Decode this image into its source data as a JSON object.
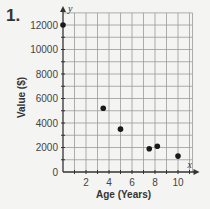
{
  "problem_number": "1.",
  "chart_data": {
    "type": "scatter",
    "title": "",
    "xlabel": "Age (Years)",
    "ylabel": "Value ($)",
    "x_axis_name": "x",
    "y_axis_name": "y",
    "xlim": [
      0,
      11.5
    ],
    "ylim": [
      0,
      12500
    ],
    "x_ticks": [
      2,
      4,
      6,
      8,
      10
    ],
    "y_ticks": [
      2000,
      4000,
      6000,
      8000,
      10000,
      12000
    ],
    "origin_label": "0",
    "grid": true,
    "x_grid_step": 1,
    "y_grid_step": 1000,
    "points": [
      {
        "x": 0,
        "y": 12000
      },
      {
        "x": 3.5,
        "y": 5200
      },
      {
        "x": 5,
        "y": 3500
      },
      {
        "x": 7.5,
        "y": 1900
      },
      {
        "x": 8.2,
        "y": 2100
      },
      {
        "x": 10,
        "y": 1300
      }
    ],
    "colors": {
      "grid": "#9a9a9a",
      "axis": "#333333",
      "point": "#1a1a1a"
    }
  }
}
